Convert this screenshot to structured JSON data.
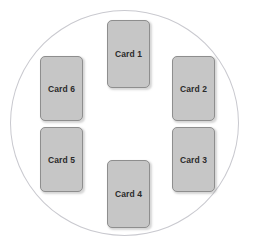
{
  "diagram": {
    "title_fragment": "",
    "shape": "circle",
    "circle": {
      "stroke_color": "#c9c9cf",
      "fill": "none"
    },
    "card_style": {
      "fill_color": "#c6c6c6",
      "border_color": "#8e8e8e",
      "text_color": "#2b2b2b"
    },
    "cards": [
      {
        "id": "card-1",
        "label": "Card 1",
        "position": "top-center"
      },
      {
        "id": "card-2",
        "label": "Card 2",
        "position": "right-upper"
      },
      {
        "id": "card-3",
        "label": "Card 3",
        "position": "right-lower"
      },
      {
        "id": "card-4",
        "label": "Card 4",
        "position": "bottom-center"
      },
      {
        "id": "card-5",
        "label": "Card 5",
        "position": "left-lower"
      },
      {
        "id": "card-6",
        "label": "Card 6",
        "position": "left-upper"
      }
    ]
  }
}
